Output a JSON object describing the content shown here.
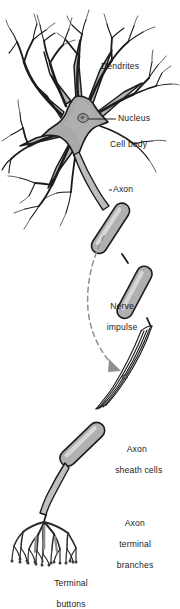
{
  "figure": {
    "background_color": "#ffffff",
    "ink_color": "#1c1c1c",
    "cell_fill_color": "#a9a9a9",
    "sheath_fill_color": "#b0b0b0",
    "impulse_line_color": "#8f8f8f"
  },
  "labels": {
    "dendrites": "Dendrites",
    "nucleus": "Nucleus",
    "cell_body": "Cell body",
    "axon": "Axon",
    "nerve_impulse_line1": "Nerve",
    "nerve_impulse_line2": "impulse",
    "axon_sheath_line1": "Axon",
    "axon_sheath_line2": "sheath cells",
    "axon_terminal_line1": "Axon",
    "axon_terminal_line2": "terminal",
    "axon_terminal_line3": "branches",
    "terminal_buttons_line1": "Terminal",
    "terminal_buttons_line2": "buttons"
  },
  "parts": [
    {
      "name": "dendrites",
      "label": "Dendrites"
    },
    {
      "name": "nucleus",
      "label": "Nucleus"
    },
    {
      "name": "cell-body",
      "label": "Cell body"
    },
    {
      "name": "axon",
      "label": "Axon"
    },
    {
      "name": "nerve-impulse",
      "label": "Nerve impulse"
    },
    {
      "name": "axon-sheath-cells",
      "label": "Axon sheath cells"
    },
    {
      "name": "axon-terminal-branches",
      "label": "Axon terminal branches"
    },
    {
      "name": "terminal-buttons",
      "label": "Terminal buttons"
    }
  ]
}
